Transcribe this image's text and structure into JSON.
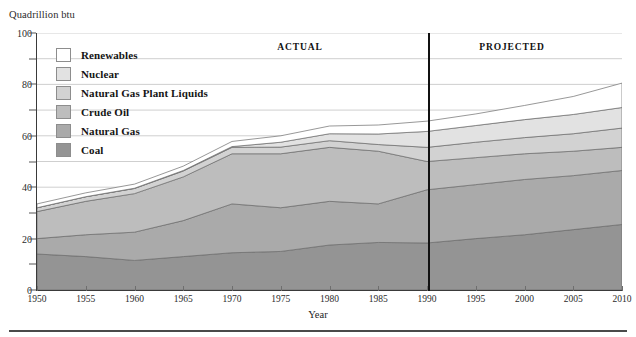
{
  "axis_unit_caption": "Quadrillion btu",
  "legend": {
    "items": [
      {
        "label": "Renewables",
        "color": "#ffffff"
      },
      {
        "label": "Nuclear",
        "color": "#e2e2e2"
      },
      {
        "label": "Natural Gas Plant Liquids",
        "color": "#d2d2d2"
      },
      {
        "label": "Crude Oil",
        "color": "#bdbdbd"
      },
      {
        "label": "Natural Gas",
        "color": "#aaaaaa"
      },
      {
        "label": "Coal",
        "color": "#949494"
      }
    ]
  },
  "periods": {
    "actual_label": "ACTUAL",
    "projected_label": "PROJECTED",
    "divider_year": 1990
  },
  "chart_data": {
    "type": "area",
    "title": "",
    "xlabel": "Year",
    "ylabel": "Quadrillion btu",
    "xlim": [
      1950,
      2010
    ],
    "ylim": [
      0,
      100
    ],
    "grid": true,
    "legend_position": "upper-left",
    "y_major_ticks": [
      0,
      20,
      40,
      60,
      80,
      100
    ],
    "y_minor_ticks": [
      10,
      30,
      50,
      70,
      90
    ],
    "x_ticks": [
      1950,
      1955,
      1960,
      1965,
      1970,
      1975,
      1980,
      1985,
      1990,
      1995,
      2000,
      2005,
      2010
    ],
    "x": [
      1950,
      1955,
      1960,
      1965,
      1970,
      1975,
      1980,
      1985,
      1990,
      1995,
      2000,
      2005,
      2010
    ],
    "stack_order_bottom_to_top": [
      "Coal",
      "Natural Gas",
      "Crude Oil",
      "Natural Gas Plant Liquids",
      "Nuclear",
      "Renewables"
    ],
    "series": [
      {
        "name": "Coal",
        "color": "#949494",
        "values": [
          14.0,
          13.0,
          11.5,
          13.0,
          14.5,
          15.0,
          17.5,
          18.5,
          18.3,
          20.0,
          21.5,
          23.5,
          25.5
        ]
      },
      {
        "name": "Natural Gas",
        "color": "#aaaaaa",
        "values": [
          6.0,
          8.5,
          11.0,
          14.0,
          19.0,
          17.0,
          17.0,
          15.0,
          20.7,
          21.0,
          21.5,
          21.0,
          21.0
        ]
      },
      {
        "name": "Crude Oil",
        "color": "#bdbdbd",
        "values": [
          10.5,
          13.0,
          15.0,
          17.0,
          19.5,
          21.0,
          21.0,
          20.5,
          11.0,
          10.5,
          10.0,
          9.5,
          9.0
        ]
      },
      {
        "name": "Natural Gas Plant Liquids",
        "color": "#d2d2d2",
        "values": [
          1.5,
          1.8,
          2.0,
          2.3,
          2.5,
          2.6,
          2.6,
          2.6,
          5.5,
          6.0,
          6.3,
          6.8,
          7.5
        ]
      },
      {
        "name": "Nuclear",
        "color": "#e2e2e2",
        "values": [
          0.0,
          0.0,
          0.1,
          0.2,
          0.3,
          1.9,
          2.7,
          4.1,
          6.2,
          6.5,
          7.0,
          7.5,
          8.0
        ]
      },
      {
        "name": "Renewables",
        "color": "#ffffff",
        "values": [
          1.5,
          1.5,
          1.6,
          1.7,
          2.0,
          2.5,
          3.0,
          3.5,
          4.0,
          4.5,
          5.5,
          7.0,
          9.5
        ]
      }
    ],
    "totals": [
      33.5,
      37.8,
      41.2,
      48.2,
      57.8,
      60.0,
      63.8,
      64.2,
      65.7,
      68.5,
      71.8,
      75.3,
      80.5
    ],
    "annotations": [
      {
        "text": "ACTUAL",
        "x": 1972
      },
      {
        "text": "PROJECTED",
        "x": 1994
      }
    ]
  }
}
